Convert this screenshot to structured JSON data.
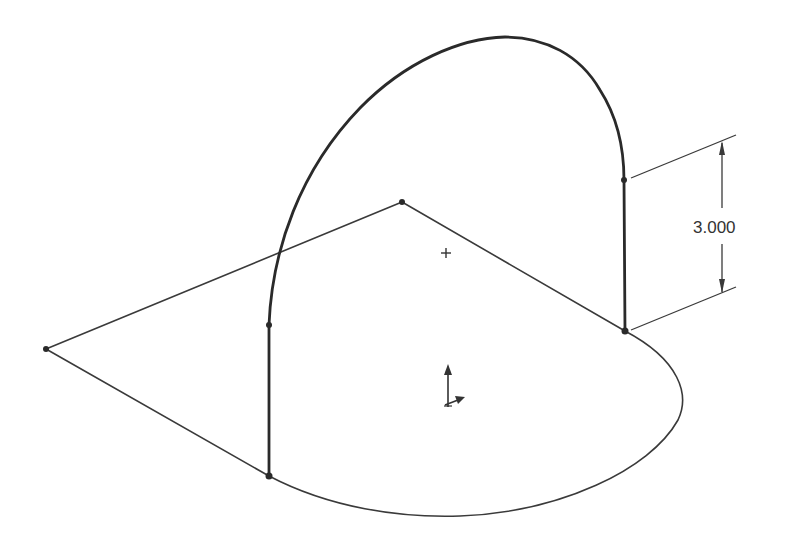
{
  "drawing": {
    "type": "3D sketch / CAD wireframe",
    "dimension": {
      "label": "3.000",
      "orientation": "vertical"
    },
    "markers": {
      "origin_marker": "plus-icon",
      "coordinate_triad": "triad-icon"
    },
    "colors": {
      "background": "#ffffff",
      "line": "#2a2a2a"
    }
  }
}
